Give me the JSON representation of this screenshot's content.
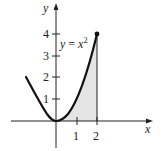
{
  "chart_data": {
    "type": "area",
    "title": "",
    "function_label": "y = x²",
    "xlabel": "x",
    "ylabel": "y",
    "x_ticks": [
      1,
      2
    ],
    "y_ticks": [
      1,
      2,
      3,
      4
    ],
    "curve": {
      "expression": "y = x^2",
      "x_range": [
        -1.45,
        2
      ],
      "points": [
        [
          -1.45,
          2.1
        ],
        [
          -1,
          1
        ],
        [
          -0.5,
          0.25
        ],
        [
          0,
          0
        ],
        [
          0.5,
          0.25
        ],
        [
          1,
          1
        ],
        [
          1.5,
          2.25
        ],
        [
          2,
          4
        ]
      ],
      "endpoint": [
        2,
        4
      ]
    },
    "shaded_region": {
      "from_x": 0,
      "to_x": 2,
      "under": "y = x^2",
      "color": "#e6e6e6"
    },
    "xlim": [
      -2.3,
      4.8
    ],
    "ylim": [
      -1.2,
      5.5
    ],
    "grid": false
  },
  "labels": {
    "x_axis": "x",
    "y_axis": "y",
    "func_y": "y",
    "func_eq": " = x",
    "func_exp": "2",
    "xt1": "1",
    "xt2": "2",
    "yt1": "1",
    "yt2": "2",
    "yt3": "3",
    "yt4": "4"
  }
}
